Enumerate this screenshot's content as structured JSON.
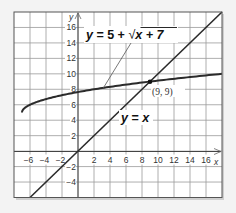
{
  "chart_data": {
    "type": "line",
    "title": "",
    "xlabel": "x",
    "ylabel": "y",
    "xlim": [
      -8,
      18
    ],
    "ylim": [
      -6,
      18
    ],
    "grid": true,
    "grid_step": 2,
    "x_ticks": [
      "-6",
      "-4",
      "-2",
      "2",
      "4",
      "6",
      "8",
      "10",
      "12",
      "14",
      "16"
    ],
    "y_ticks": [
      "16",
      "14",
      "12",
      "10",
      "8",
      "6",
      "4",
      "2",
      "-2",
      "-4"
    ],
    "series": [
      {
        "name": "y = 5 + √(x + 7)",
        "function": "5 + sqrt(x + 7)",
        "domain": [
          -7,
          18
        ],
        "points": [
          [
            -7,
            5
          ],
          [
            -6,
            6
          ],
          [
            -3,
            7
          ],
          [
            2,
            8
          ],
          [
            9,
            9
          ],
          [
            18,
            10
          ]
        ]
      },
      {
        "name": "y = x",
        "function": "x",
        "domain": [
          -6,
          18
        ],
        "points": [
          [
            -6,
            -6
          ],
          [
            0,
            0
          ],
          [
            9,
            9
          ],
          [
            18,
            18
          ]
        ]
      }
    ],
    "annotations": [
      {
        "text": "(9, 9)",
        "x": 9,
        "y": 9,
        "type": "intersection-point"
      },
      {
        "text": "y = 5 + √x + 7",
        "target": "curve",
        "leader_line": true
      },
      {
        "text": "y = x",
        "target": "line"
      }
    ]
  },
  "labels": {
    "curve_label_y": "y",
    "curve_label_eq": " = 5 + ",
    "curve_label_sqrt": "√",
    "curve_label_rad": "x + 7",
    "line_label_y": "y",
    "line_label_eq": " = ",
    "line_label_x": "x",
    "point_label": "(9, 9)",
    "axis_x": "x",
    "axis_y": "y"
  },
  "colors": {
    "background": "#f3f3f3",
    "plot_bg": "#ffffff",
    "grid": "#9a9a9a",
    "axis": "#444444",
    "curve": "#2b2b2b",
    "line": "#2b2b2b",
    "border": "#555555",
    "shadow": "#b8b8b8"
  }
}
